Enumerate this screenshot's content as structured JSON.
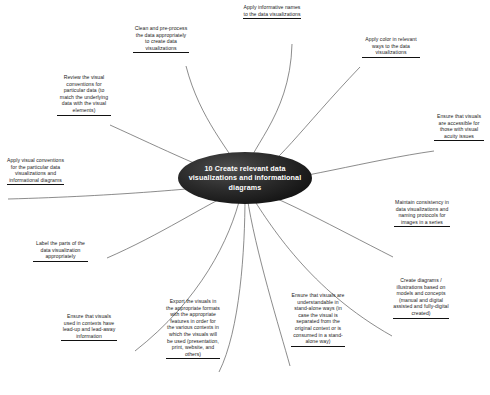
{
  "diagram": {
    "type": "mind-map",
    "title": "10 Create relevant data visualizations and informational diagrams",
    "center": {
      "label": "10 Create relevant data visualizations and informational diagrams",
      "shape": "ellipse",
      "fill": "#141414",
      "text_color": "#ffffff"
    },
    "style": {
      "background": "#ffffff",
      "edge_color": "#555555",
      "leaf_text_color": "#1a1a1a",
      "leaf_rule_color": "#111111"
    },
    "branch_count": 13,
    "branches": [
      {
        "id": "apply-informative-names",
        "label": "Apply informative names to the data visualizations",
        "align": "center"
      },
      {
        "id": "clean-and-preprocess",
        "label": "Clean and pre-process the data appropriately to create data visualizations",
        "align": "center"
      },
      {
        "id": "apply-color",
        "label": "Apply color in relevant ways to the data visualizations",
        "align": "center"
      },
      {
        "id": "review-visual-conventions",
        "label": "Review the visual conventions for particular data (to match the underlying data with the visual elements)",
        "align": "center"
      },
      {
        "id": "ensure-accessible",
        "label": "Ensure that visuals are accessible for those with visual acuity issues",
        "align": "center"
      },
      {
        "id": "apply-visual-conventions",
        "label": "Apply visual conventions for the particular data visualizations and informational diagrams",
        "align": "center"
      },
      {
        "id": "maintain-consistency",
        "label": "Maintain consistency in data visualizations and naming protocols for images in a series",
        "align": "center"
      },
      {
        "id": "label-the-parts",
        "label": "Label the parts of the data visualization appropriately",
        "align": "center"
      },
      {
        "id": "create-diagrams-illustrations",
        "label": "Create diagrams / illustrations based on models and concepts (manual and digital assisted and fully-digital created)",
        "align": "center"
      },
      {
        "id": "ensure-lead-up-lead-away",
        "label": "Ensure that visuals used in contexts have lead-up and lead-away information",
        "align": "center"
      },
      {
        "id": "export-the-visuals",
        "label": "Export the visuals in the appropriate formats with the appropriate features in order for the various contexts in which the visuals will be used (presentation, print, website, and others)",
        "align": "center"
      },
      {
        "id": "ensure-stand-alone",
        "label": "Ensure that visuals are understandable in stand-alone ways (in case the visual is separated from the original context or is consumed in a stand-alone way)",
        "align": "center"
      }
    ]
  }
}
